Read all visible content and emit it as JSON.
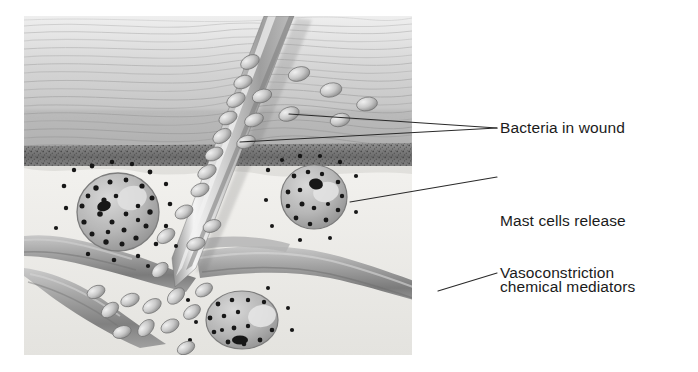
{
  "figure": {
    "panel": {
      "x": 24,
      "y": 16,
      "width": 388,
      "height": 339
    },
    "background_color": "#ffffff",
    "style": "grayscale pencil medical illustration"
  },
  "labels": [
    {
      "id": "bacteria",
      "text": "Bacteria in wound",
      "text_x": 500,
      "text_y": 117,
      "leaders": [
        {
          "x1": 497,
          "y1": 128,
          "x2": 289,
          "y2": 114
        },
        {
          "x1": 497,
          "y1": 128,
          "x2": 240,
          "y2": 142
        }
      ]
    },
    {
      "id": "mast-cells",
      "line1": "Mast cells release",
      "line2": "chemical mediators",
      "text_x": 500,
      "text_y": 166,
      "leaders": [
        {
          "x1": 497,
          "y1": 177,
          "x2": 350,
          "y2": 202
        }
      ]
    },
    {
      "id": "vasoconstriction",
      "text": "Vasoconstriction",
      "text_x": 500,
      "text_y": 262,
      "leaders": [
        {
          "x1": 497,
          "y1": 273,
          "x2": 438,
          "y2": 291
        }
      ]
    }
  ],
  "anatomy": {
    "epidermis": {
      "label": "epidermis",
      "y_top": 16,
      "y_bottom": 150,
      "color": "#cfcfcf"
    },
    "dermis_band": {
      "label": "dermal stippled band",
      "y_top": 148,
      "y_bottom": 170,
      "color": "#6e6e6e"
    },
    "deep_tissue": {
      "label": "subcutaneous tissue",
      "y_top": 168,
      "y_bottom": 355,
      "color": "#ededea"
    }
  },
  "objects": {
    "splinter": {
      "name": "splinter",
      "tip_x": 175,
      "tip_y": 287,
      "top_x": 290,
      "top_y": 16
    },
    "blood_vessel": {
      "name": "blood vessel",
      "opening_x": 432,
      "opening_y": 296,
      "lumen_color": "#3a3a3a"
    },
    "mast_cells": [
      {
        "cx": 118,
        "cy": 212,
        "rx": 40,
        "ry": 38
      },
      {
        "cx": 314,
        "cy": 197,
        "rx": 32,
        "ry": 31
      },
      {
        "cx": 242,
        "cy": 320,
        "rx": 35,
        "ry": 28
      }
    ],
    "bacteria_count": 34,
    "granule_count": 96
  },
  "colors": {
    "ink": "#1b1b1b",
    "leader_line": "#2a2a2a",
    "skin_light": "#dedede",
    "skin_mid": "#bdbdbd",
    "dermis_dark": "#676767",
    "deep": "#eceae7",
    "vessel": "#9a9a9a",
    "vessel_dark": "#4a4a4a",
    "granule": "#161616"
  }
}
